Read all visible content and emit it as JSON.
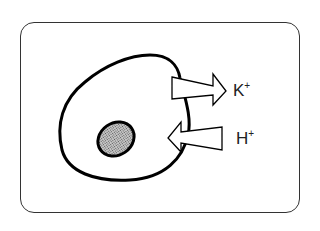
{
  "diagram": {
    "ions": [
      {
        "symbol": "K",
        "charge": "+",
        "direction": "out"
      },
      {
        "symbol": "H",
        "charge": "+",
        "direction": "in"
      }
    ],
    "colors": {
      "outline": "#000000",
      "nucleus_fill": "#a8a8a8",
      "background": "#ffffff",
      "frame": "#333333"
    }
  }
}
